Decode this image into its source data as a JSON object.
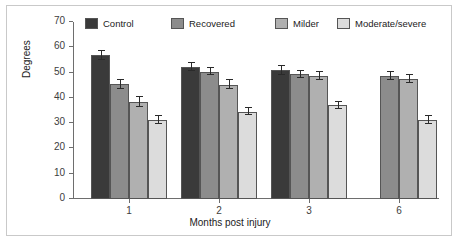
{
  "chart_data": {
    "type": "bar",
    "title": "",
    "xlabel": "Months post injury",
    "ylabel": "Degrees",
    "categories": [
      "1",
      "2",
      "3",
      "6"
    ],
    "ylim": [
      0,
      70
    ],
    "yticks": [
      0,
      10,
      20,
      30,
      40,
      50,
      60,
      70
    ],
    "grid": false,
    "legend_position": "top",
    "series": [
      {
        "name": "Control",
        "color": "#3a3a3a",
        "values": [
          56.8,
          52.3,
          51.0,
          null
        ],
        "errors": [
          1.8,
          1.6,
          1.8,
          null
        ]
      },
      {
        "name": "Recovered",
        "color": "#8c8c8c",
        "values": [
          45.3,
          50.4,
          49.3,
          48.7
        ],
        "errors": [
          1.7,
          1.5,
          1.5,
          1.6
        ]
      },
      {
        "name": "Milder",
        "color": "#b0b0b0",
        "values": [
          38.4,
          45.2,
          48.6,
          47.5
        ],
        "errors": [
          2.0,
          1.7,
          1.6,
          1.7
        ]
      },
      {
        "name": "Moderate/severe",
        "color": "#dcdcdc",
        "values": [
          31.2,
          34.6,
          37.0,
          31.1
        ],
        "errors": [
          1.6,
          1.4,
          1.4,
          1.6
        ]
      }
    ]
  },
  "legend": {
    "items": [
      {
        "label": "Control",
        "color": "#3a3a3a"
      },
      {
        "label": "Recovered",
        "color": "#8c8c8c"
      },
      {
        "label": "Milder",
        "color": "#b0b0b0"
      },
      {
        "label": "Moderate/severe",
        "color": "#dcdcdc"
      }
    ]
  },
  "axes": {
    "y_tick_labels": [
      "70",
      "60",
      "50",
      "40",
      "30",
      "20",
      "10",
      "0"
    ],
    "x_tick_labels": [
      "1",
      "2",
      "3",
      "6"
    ],
    "y_title": "Degrees",
    "x_title": "Months post injury"
  },
  "colors": {
    "frame": "#c9c9c9",
    "axis": "#6e6e6e",
    "text": "#1b1b1b",
    "error": "#2a2a2a"
  }
}
